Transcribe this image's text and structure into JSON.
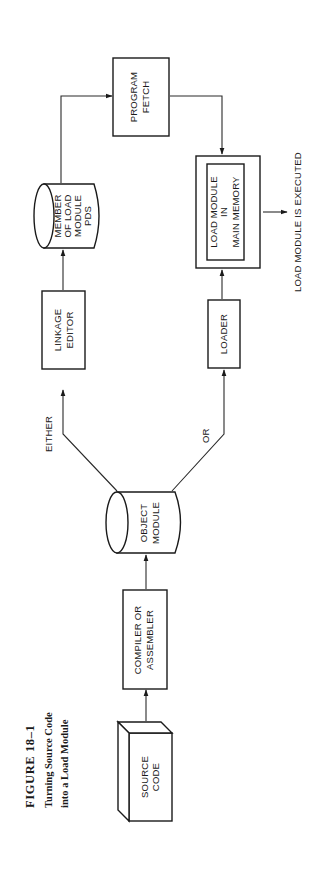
{
  "figure": {
    "number": "FIGURE  18–1",
    "caption_line1": "Turning Source Code",
    "caption_line2": "into a Load Module",
    "orientation": "rotated 90° counter-clockwise"
  },
  "nodes": {
    "source_code": {
      "shape": "3d-box",
      "lines": [
        "SOURCE",
        "CODE"
      ]
    },
    "compiler": {
      "shape": "rectangle",
      "lines": [
        "COMPILER OR",
        "ASSEMBLER"
      ]
    },
    "object_module": {
      "shape": "cylinder",
      "lines": [
        "OBJECT",
        "MODULE"
      ]
    },
    "linkage_editor": {
      "shape": "rectangle",
      "lines": [
        "LINKAGE",
        "EDITOR"
      ]
    },
    "pds_member": {
      "shape": "cylinder",
      "lines": [
        "MEMBER",
        "OF LOAD",
        "MODULE",
        "PDS"
      ]
    },
    "program_fetch": {
      "shape": "rectangle",
      "lines": [
        "PROGRAM",
        "FETCH"
      ]
    },
    "loader": {
      "shape": "rectangle",
      "lines": [
        "LOADER"
      ]
    },
    "main_memory": {
      "shape": "double-rectangle",
      "lines": [
        "LOAD MODULE",
        "IN",
        "MAIN MEMORY"
      ]
    }
  },
  "edge_labels": {
    "either": "EITHER",
    "or": "OR"
  },
  "result_text": "LOAD MODULE IS EXECUTED",
  "edges": [
    {
      "from": "source_code",
      "to": "compiler"
    },
    {
      "from": "compiler",
      "to": "object_module"
    },
    {
      "from": "object_module",
      "to": "linkage_editor",
      "label": "EITHER"
    },
    {
      "from": "object_module",
      "to": "loader",
      "label": "OR"
    },
    {
      "from": "linkage_editor",
      "to": "pds_member"
    },
    {
      "from": "pds_member",
      "to": "program_fetch"
    },
    {
      "from": "program_fetch",
      "to": "main_memory"
    },
    {
      "from": "loader",
      "to": "main_memory"
    },
    {
      "from": "main_memory",
      "to": "result_text"
    }
  ]
}
